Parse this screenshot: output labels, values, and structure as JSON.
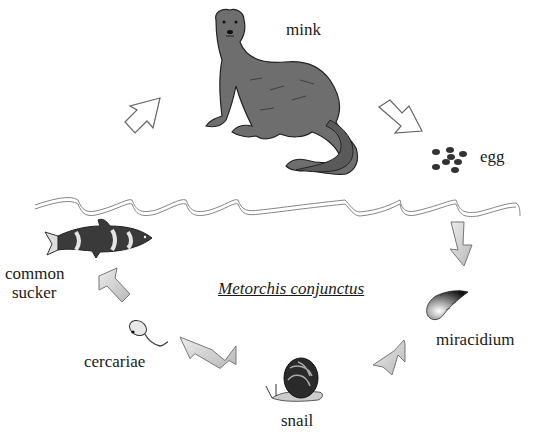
{
  "diagram": {
    "title": "Metorchis conjunctus",
    "type": "life-cycle",
    "stages": [
      {
        "id": "mink",
        "label": "mink",
        "role": "definitive host"
      },
      {
        "id": "egg",
        "label": "egg"
      },
      {
        "id": "miracidium",
        "label": "miracidium"
      },
      {
        "id": "snail",
        "label": "snail",
        "role": "first intermediate host"
      },
      {
        "id": "cercariae",
        "label": "cercariae"
      },
      {
        "id": "common-sucker",
        "label_line1": "common",
        "label_line2": "sucker",
        "role": "second intermediate host"
      }
    ],
    "arrows": [
      {
        "from": "common-sucker",
        "to": "mink",
        "style": "outline"
      },
      {
        "from": "mink",
        "to": "egg",
        "style": "outline"
      },
      {
        "from": "egg",
        "to": "miracidium",
        "style": "shaded"
      },
      {
        "from": "miracidium",
        "to": "snail",
        "style": "shaded"
      },
      {
        "from": "snail",
        "to": "cercariae",
        "style": "shaded"
      },
      {
        "from": "cercariae",
        "to": "common-sucker",
        "style": "shaded"
      }
    ],
    "water_line": "wavy double line separating land (above) and water (below)"
  },
  "colors": {
    "outline_arrow": "#ffffff",
    "shaded_arrow": "#cfcfcf",
    "mink_fill": "#6e6e6e",
    "text": "#1a1a1a"
  }
}
